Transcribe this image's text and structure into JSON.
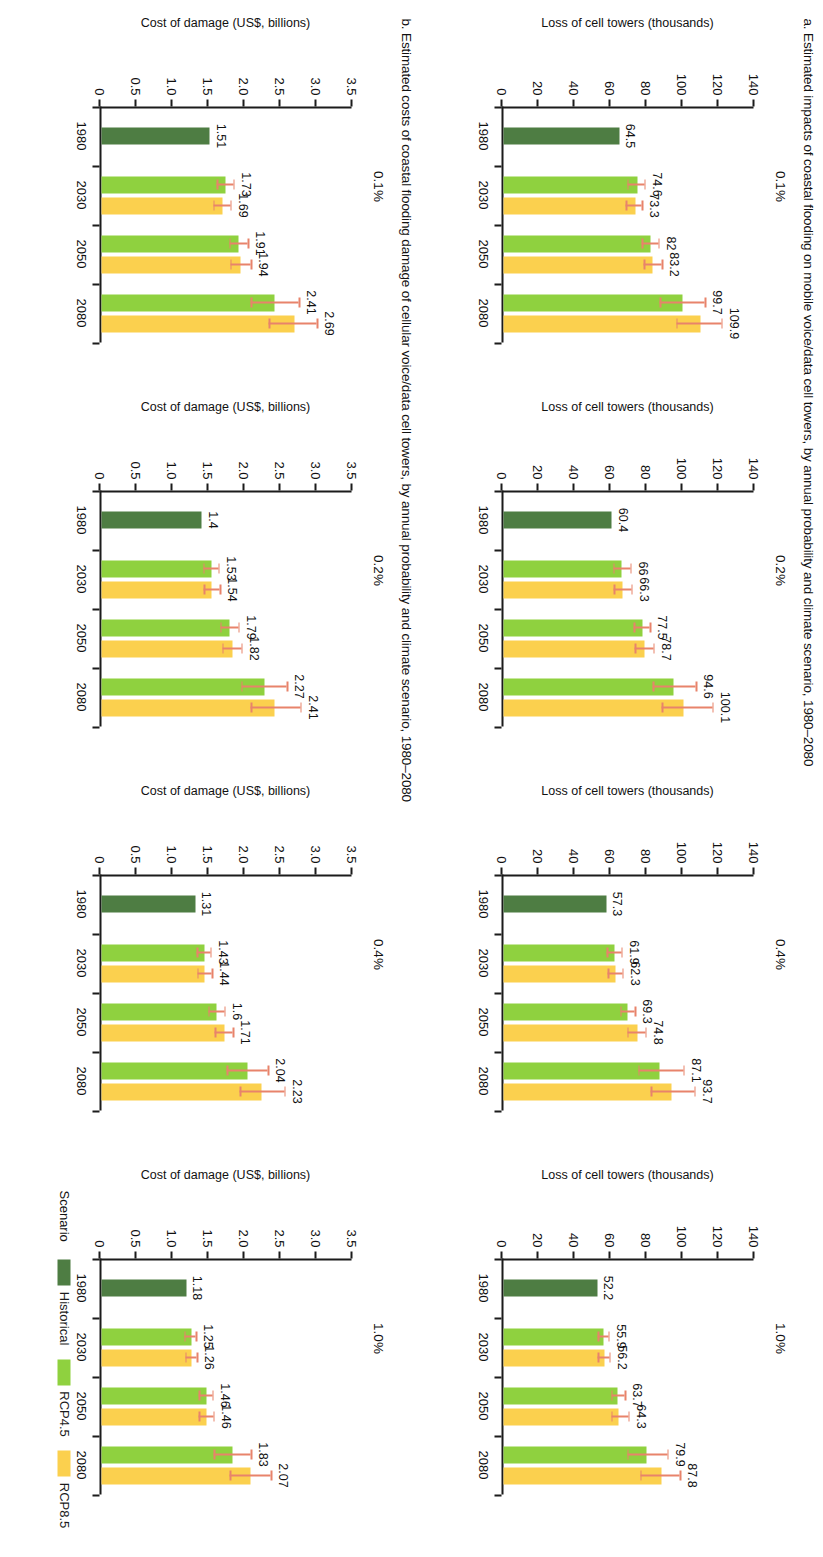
{
  "figure": {
    "panel_a_title": "a. Estimated impacts of coastal flooding on mobile voice/data cell towers, by annual probability and climate scenario, 1980–2080",
    "panel_b_title": "b. Estimated costs of coastal flooding damage of cellular voice/data cell towers, by annual probability and climate scenario, 1980–2080"
  },
  "legend": {
    "title": "Scenario",
    "items": [
      {
        "label": "Historical",
        "color": "#4e7d43"
      },
      {
        "label": "RCP4.5",
        "color": "#8fd13f"
      },
      {
        "label": "RCP8.5",
        "color": "#fbd04e"
      }
    ]
  },
  "chart_data": [
    {
      "type": "bar",
      "id": "a-0.1",
      "title": "0.1%",
      "xlabel": "",
      "ylabel": "Loss of cell towers (thousands)",
      "ylim": [
        0,
        140
      ],
      "yticks": [
        "0",
        "20",
        "40",
        "60",
        "80",
        "100",
        "120",
        "140"
      ],
      "categories": [
        "1980",
        "2030",
        "2050",
        "2080"
      ],
      "series": [
        {
          "name": "Historical",
          "color": "#4e7d43",
          "values": [
            64.5,
            null,
            null,
            null
          ]
        },
        {
          "name": "RCP4.5",
          "color": "#8fd13f",
          "values": [
            null,
            74.6,
            82,
            99.7
          ],
          "err_low": [
            null,
            70.0,
            78.0,
            88.0
          ],
          "err_high": [
            null,
            79.5,
            87.0,
            113.0
          ]
        },
        {
          "name": "RCP8.5",
          "color": "#fbd04e",
          "values": [
            null,
            73.3,
            83.2,
            109.9
          ],
          "err_low": [
            null,
            69.0,
            79.0,
            97.0
          ],
          "err_high": [
            null,
            78.0,
            89.0,
            122.0
          ]
        }
      ],
      "labels": [
        "64.5",
        "74.6",
        "73.3",
        "82",
        "83.2",
        "99.7",
        "109.9"
      ]
    },
    {
      "type": "bar",
      "id": "a-0.2",
      "title": "0.2%",
      "xlabel": "",
      "ylabel": "Loss of cell towers (thousands)",
      "ylim": [
        0,
        140
      ],
      "yticks": [
        "0",
        "20",
        "40",
        "60",
        "80",
        "100",
        "120",
        "140"
      ],
      "categories": [
        "1980",
        "2030",
        "2050",
        "2080"
      ],
      "series": [
        {
          "name": "Historical",
          "color": "#4e7d43",
          "values": [
            60.4,
            null,
            null,
            null
          ]
        },
        {
          "name": "RCP4.5",
          "color": "#8fd13f",
          "values": [
            null,
            66,
            77.5,
            94.6
          ],
          "err_low": [
            null,
            62.0,
            73.5,
            84.0
          ],
          "err_high": [
            null,
            71.5,
            82.5,
            108.0
          ]
        },
        {
          "name": "RCP8.5",
          "color": "#fbd04e",
          "values": [
            null,
            66.3,
            78.7,
            100.1
          ],
          "err_low": [
            null,
            62.5,
            74.0,
            89.0
          ],
          "err_high": [
            null,
            72.0,
            84.5,
            117.0
          ]
        }
      ],
      "labels": [
        "60.4",
        "66",
        "66.3",
        "77.5",
        "78.7",
        "94.6",
        "100.1"
      ]
    },
    {
      "type": "bar",
      "id": "a-0.4",
      "title": "0.4%",
      "xlabel": "",
      "ylabel": "Loss of cell towers (thousands)",
      "ylim": [
        0,
        140
      ],
      "yticks": [
        "0",
        "20",
        "40",
        "60",
        "80",
        "100",
        "120",
        "140"
      ],
      "categories": [
        "1980",
        "2030",
        "2050",
        "2080"
      ],
      "series": [
        {
          "name": "Historical",
          "color": "#4e7d43",
          "values": [
            57.3,
            null,
            null,
            null
          ]
        },
        {
          "name": "RCP4.5",
          "color": "#8fd13f",
          "values": [
            null,
            61.9,
            69.3,
            87.1
          ],
          "err_low": [
            null,
            58.5,
            66.0,
            76.0
          ],
          "err_high": [
            null,
            66.5,
            74.0,
            101.0
          ]
        },
        {
          "name": "RCP8.5",
          "color": "#fbd04e",
          "values": [
            null,
            62.3,
            74.8,
            93.7
          ],
          "err_low": [
            null,
            59.0,
            70.0,
            83.0
          ],
          "err_high": [
            null,
            67.0,
            80.0,
            107.0
          ]
        }
      ],
      "labels": [
        "57.3",
        "61.9",
        "62.3",
        "69.3",
        "74.8",
        "87.1",
        "93.7"
      ]
    },
    {
      "type": "bar",
      "id": "a-1.0",
      "title": "1.0%",
      "xlabel": "",
      "ylabel": "Loss of cell towers (thousands)",
      "ylim": [
        0,
        140
      ],
      "yticks": [
        "0",
        "20",
        "40",
        "60",
        "80",
        "100",
        "120",
        "140"
      ],
      "categories": [
        "1980",
        "2030",
        "2050",
        "2080"
      ],
      "series": [
        {
          "name": "Historical",
          "color": "#4e7d43",
          "values": [
            52.2,
            null,
            null,
            null
          ]
        },
        {
          "name": "RCP4.5",
          "color": "#8fd13f",
          "values": [
            null,
            55.9,
            63.7,
            79.9
          ],
          "err_low": [
            null,
            53.5,
            61.0,
            70.0
          ],
          "err_high": [
            null,
            59.5,
            68.5,
            92.0
          ]
        },
        {
          "name": "RCP8.5",
          "color": "#fbd04e",
          "values": [
            null,
            56.2,
            64.3,
            87.8
          ],
          "err_low": [
            null,
            53.5,
            61.0,
            77.0
          ],
          "err_high": [
            null,
            60.0,
            70.5,
            99.0
          ]
        }
      ],
      "labels": [
        "52.2",
        "55.9",
        "56.2",
        "63.7",
        "64.3",
        "79.9",
        "87.8"
      ]
    },
    {
      "type": "bar",
      "id": "b-0.1",
      "title": "0.1%",
      "xlabel": "",
      "ylabel": "Cost of damage (US$, billions)",
      "ylim": [
        0,
        3.5
      ],
      "yticks": [
        "0",
        "0.5",
        "1.0",
        "1.5",
        "2.0",
        "2.5",
        "3.0",
        "3.5"
      ],
      "categories": [
        "1980",
        "2030",
        "2050",
        "2080"
      ],
      "series": [
        {
          "name": "Historical",
          "color": "#4e7d43",
          "values": [
            1.51,
            null,
            null,
            null
          ]
        },
        {
          "name": "RCP4.5",
          "color": "#8fd13f",
          "values": [
            null,
            1.73,
            1.91,
            2.41
          ],
          "err_low": [
            null,
            1.63,
            1.8,
            2.1
          ],
          "err_high": [
            null,
            1.86,
            2.06,
            2.77
          ]
        },
        {
          "name": "RCP8.5",
          "color": "#fbd04e",
          "values": [
            null,
            1.69,
            1.94,
            2.69
          ],
          "err_low": [
            null,
            1.58,
            1.82,
            2.35
          ],
          "err_high": [
            null,
            1.82,
            2.1,
            3.02
          ]
        }
      ],
      "labels": [
        "1.51",
        "1.73",
        "1.69",
        "1.91",
        "1.94",
        "2.41",
        "2.69"
      ]
    },
    {
      "type": "bar",
      "id": "b-0.2",
      "title": "0.2%",
      "xlabel": "",
      "ylabel": "Cost of damage (US$, billions)",
      "ylim": [
        0,
        3.5
      ],
      "yticks": [
        "0",
        "0.5",
        "1.0",
        "1.5",
        "2.0",
        "2.5",
        "3.0",
        "3.5"
      ],
      "categories": [
        "1980",
        "2030",
        "2050",
        "2080"
      ],
      "series": [
        {
          "name": "Historical",
          "color": "#4e7d43",
          "values": [
            1.4,
            null,
            null,
            null
          ]
        },
        {
          "name": "RCP4.5",
          "color": "#8fd13f",
          "values": [
            null,
            1.53,
            1.79,
            2.27
          ],
          "err_low": [
            null,
            1.44,
            1.68,
            1.97
          ],
          "err_high": [
            null,
            1.65,
            1.93,
            2.6
          ]
        },
        {
          "name": "RCP8.5",
          "color": "#fbd04e",
          "values": [
            null,
            1.54,
            1.82,
            2.41
          ],
          "err_low": [
            null,
            1.45,
            1.71,
            2.1
          ],
          "err_high": [
            null,
            1.67,
            1.97,
            2.79
          ]
        }
      ],
      "labels": [
        "1.4",
        "1.53",
        "1.54",
        "1.79",
        "1.82",
        "2.27",
        "2.41"
      ]
    },
    {
      "type": "bar",
      "id": "b-0.4",
      "title": "0.4%",
      "xlabel": "",
      "ylabel": "Cost of damage (US$, billions)",
      "ylim": [
        0,
        3.5
      ],
      "yticks": [
        "0",
        "0.5",
        "1.0",
        "1.5",
        "2.0",
        "2.5",
        "3.0",
        "3.5"
      ],
      "categories": [
        "1980",
        "2030",
        "2050",
        "2080"
      ],
      "series": [
        {
          "name": "Historical",
          "color": "#4e7d43",
          "values": [
            1.31,
            null,
            null,
            null
          ]
        },
        {
          "name": "RCP4.5",
          "color": "#8fd13f",
          "values": [
            null,
            1.43,
            1.6,
            2.04
          ],
          "err_low": [
            null,
            1.35,
            1.51,
            1.77
          ],
          "err_high": [
            null,
            1.54,
            1.73,
            2.34
          ]
        },
        {
          "name": "RCP8.5",
          "color": "#fbd04e",
          "values": [
            null,
            1.44,
            1.71,
            2.23
          ],
          "err_low": [
            null,
            1.36,
            1.6,
            1.95
          ],
          "err_high": [
            null,
            1.56,
            1.85,
            2.57
          ]
        }
      ],
      "labels": [
        "1.31",
        "1.43",
        "1.44",
        "1.6",
        "1.71",
        "2.04",
        "2.23"
      ]
    },
    {
      "type": "bar",
      "id": "b-1.0",
      "title": "1.0%",
      "xlabel": "",
      "ylabel": "Cost of damage (US$, billions)",
      "ylim": [
        0,
        3.5
      ],
      "yticks": [
        "0",
        "0.5",
        "1.0",
        "1.5",
        "2.0",
        "2.5",
        "3.0",
        "3.5"
      ],
      "categories": [
        "1980",
        "2030",
        "2050",
        "2080"
      ],
      "series": [
        {
          "name": "Historical",
          "color": "#4e7d43",
          "values": [
            1.18,
            null,
            null,
            null
          ]
        },
        {
          "name": "RCP4.5",
          "color": "#8fd13f",
          "values": [
            null,
            1.25,
            1.46,
            1.83
          ],
          "err_low": [
            null,
            1.18,
            1.38,
            1.59
          ],
          "err_high": [
            null,
            1.34,
            1.57,
            2.1
          ]
        },
        {
          "name": "RCP8.5",
          "color": "#fbd04e",
          "values": [
            null,
            1.26,
            1.46,
            2.07
          ],
          "err_low": [
            null,
            1.19,
            1.38,
            1.81
          ],
          "err_high": [
            null,
            1.35,
            1.58,
            2.38
          ]
        }
      ],
      "labels": [
        "1.18",
        "1.25",
        "1.26",
        "1.46",
        "1.46",
        "1.83",
        "2.07"
      ]
    }
  ]
}
